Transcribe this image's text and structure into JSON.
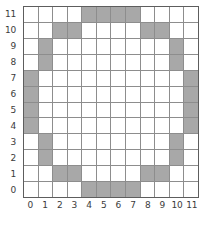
{
  "chart_data": {
    "type": "heatmap",
    "title": "",
    "xlabel": "",
    "ylabel": "",
    "xlim": [
      0,
      11
    ],
    "ylim": [
      0,
      11
    ],
    "grid": true,
    "legend": null,
    "x_tick_labels": [
      "0",
      "1",
      "2",
      "3",
      "4",
      "5",
      "6",
      "7",
      "8",
      "9",
      "10",
      "11"
    ],
    "y_tick_labels": [
      "11",
      "10",
      "9",
      "8",
      "7",
      "6",
      "5",
      "4",
      "3",
      "2",
      "1",
      "0"
    ],
    "columns": 12,
    "rows": 12,
    "colors": {
      "filled_cell": "#a8a8a8",
      "empty_cell": "#ffffff",
      "grid_line": "#8d8d8d",
      "frame_line": "#5d5d5d",
      "tick_label": "#3b3b3b",
      "background": "#ffffff"
    },
    "filled_cells_by_row": [
      {
        "y": 11,
        "x": [
          4,
          5,
          6,
          7
        ]
      },
      {
        "y": 10,
        "x": [
          2,
          3,
          8,
          9
        ]
      },
      {
        "y": 9,
        "x": [
          1,
          10
        ]
      },
      {
        "y": 8,
        "x": [
          1,
          10
        ]
      },
      {
        "y": 7,
        "x": [
          0,
          11
        ]
      },
      {
        "y": 6,
        "x": [
          0,
          11
        ]
      },
      {
        "y": 5,
        "x": [
          0,
          11
        ]
      },
      {
        "y": 4,
        "x": [
          0,
          11
        ]
      },
      {
        "y": 3,
        "x": [
          1,
          10
        ]
      },
      {
        "y": 2,
        "x": [
          1,
          10
        ]
      },
      {
        "y": 1,
        "x": [
          2,
          3,
          8,
          9
        ]
      },
      {
        "y": 0,
        "x": [
          4,
          5,
          6,
          7
        ]
      }
    ],
    "matrix_top_to_bottom": [
      [
        0,
        0,
        0,
        0,
        1,
        1,
        1,
        1,
        0,
        0,
        0,
        0
      ],
      [
        0,
        0,
        1,
        1,
        0,
        0,
        0,
        0,
        1,
        1,
        0,
        0
      ],
      [
        0,
        1,
        0,
        0,
        0,
        0,
        0,
        0,
        0,
        0,
        1,
        0
      ],
      [
        0,
        1,
        0,
        0,
        0,
        0,
        0,
        0,
        0,
        0,
        1,
        0
      ],
      [
        1,
        0,
        0,
        0,
        0,
        0,
        0,
        0,
        0,
        0,
        0,
        1
      ],
      [
        1,
        0,
        0,
        0,
        0,
        0,
        0,
        0,
        0,
        0,
        0,
        1
      ],
      [
        1,
        0,
        0,
        0,
        0,
        0,
        0,
        0,
        0,
        0,
        0,
        1
      ],
      [
        1,
        0,
        0,
        0,
        0,
        0,
        0,
        0,
        0,
        0,
        0,
        1
      ],
      [
        0,
        1,
        0,
        0,
        0,
        0,
        0,
        0,
        0,
        0,
        1,
        0
      ],
      [
        0,
        1,
        0,
        0,
        0,
        0,
        0,
        0,
        0,
        0,
        1,
        0
      ],
      [
        0,
        0,
        1,
        1,
        0,
        0,
        0,
        0,
        1,
        1,
        0,
        0
      ],
      [
        0,
        0,
        0,
        0,
        1,
        1,
        1,
        1,
        0,
        0,
        0,
        0
      ]
    ],
    "filled_count": 28
  }
}
